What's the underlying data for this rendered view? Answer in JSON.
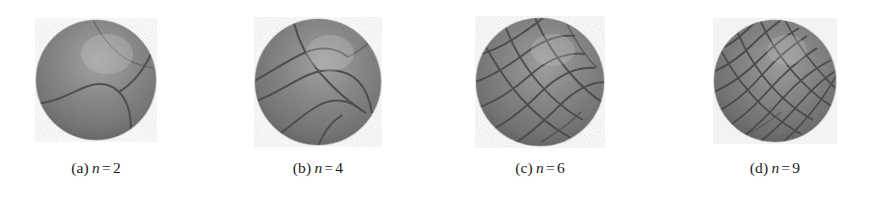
{
  "figure": {
    "background_color": "#ffffff",
    "panel_count": 4,
    "sphere_base_color": "#8a8a8a",
    "sphere_groove_color": "#4a4a4a",
    "sphere_highlight_color": "#b9b9b9",
    "caption_color": "#1b1b1b"
  },
  "panels": [
    {
      "label": "(a)",
      "variable": "n",
      "equals": "=",
      "value": "2",
      "caption_text": "(a) n = 2",
      "center_x": 96,
      "center_y": 80,
      "diameter": 122,
      "groove_count": 3,
      "pattern": "few-large-lobes"
    },
    {
      "label": "(b)",
      "variable": "n",
      "equals": "=",
      "value": "4",
      "caption_text": "(b) n = 4",
      "center_x": 318,
      "center_y": 80,
      "diameter": 126,
      "groove_count": 6,
      "pattern": "diagonal-bands"
    },
    {
      "label": "(c)",
      "variable": "n",
      "equals": "=",
      "value": "6",
      "caption_text": "(c) n = 6",
      "center_x": 540,
      "center_y": 80,
      "diameter": 128,
      "groove_count": 10,
      "pattern": "criss-cross-net"
    },
    {
      "label": "(d)",
      "variable": "n",
      "equals": "=",
      "value": "9",
      "caption_text": "(d) n = 9",
      "center_x": 775,
      "center_y": 80,
      "diameter": 122,
      "groove_count": 15,
      "pattern": "dense-spiral-mesh"
    }
  ]
}
